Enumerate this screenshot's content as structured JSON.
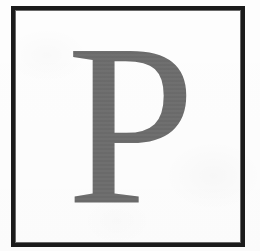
{
  "page": {
    "background_color": "#fefefe",
    "width": 260,
    "height": 251
  },
  "frame": {
    "name": "rectangular-rule-border",
    "border_color": "#1b1b1b",
    "border_width_px": 5,
    "fill_color": "#fefefe"
  },
  "content": {
    "type": "drop-cap-initial",
    "character": "P",
    "color": "#6b6b6b",
    "style": "serif-roman-capital"
  }
}
